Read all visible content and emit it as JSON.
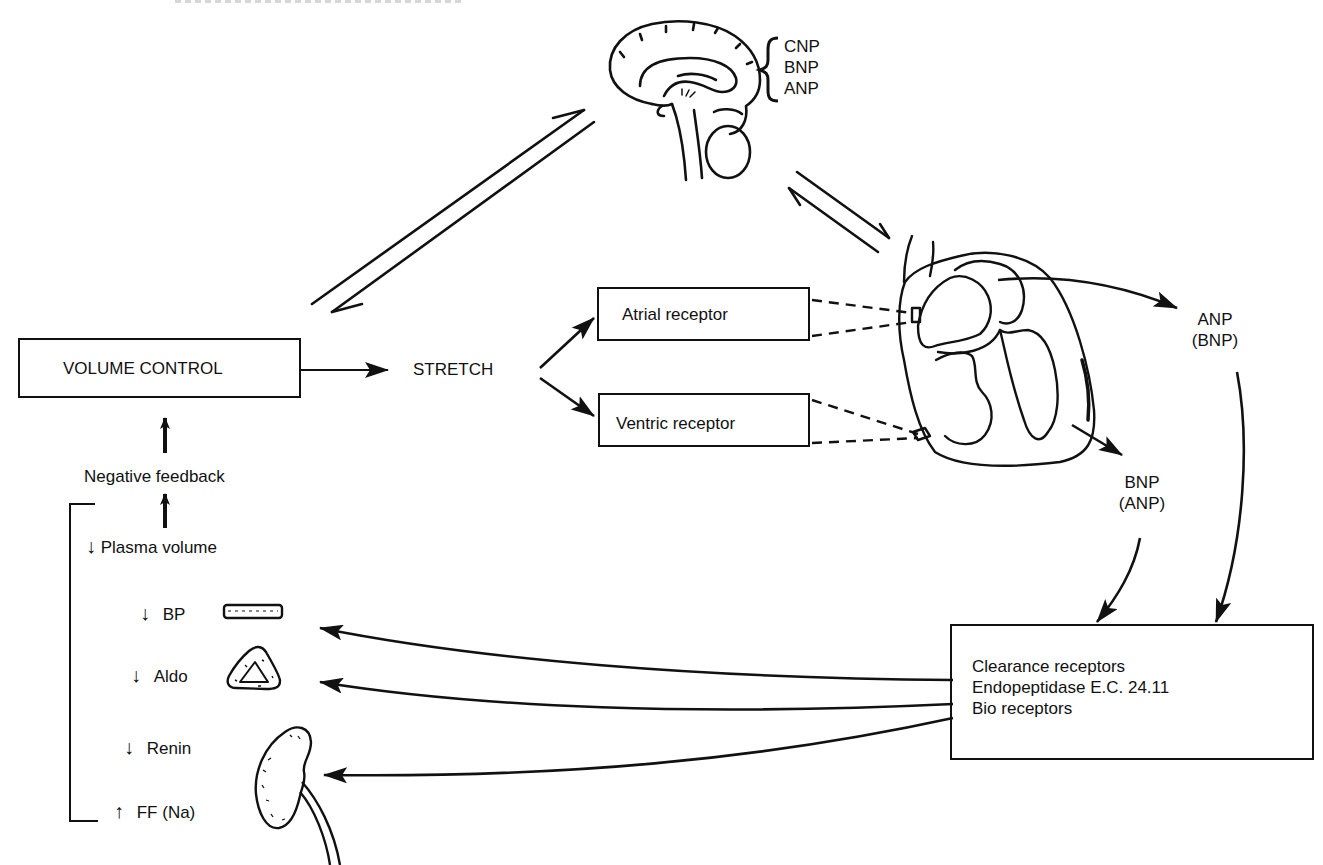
{
  "diagram": {
    "type": "physiology-flow-diagram",
    "brain": {
      "icon": "brain-sagittal-icon",
      "peptides": [
        "CNP",
        "BNP",
        "ANP"
      ]
    },
    "volume_control": {
      "label": "VOLUME CONTROL"
    },
    "stretch": {
      "label": "STRETCH"
    },
    "receptors": {
      "atrial": "Atrial receptor",
      "ventric": "Ventric receptor"
    },
    "heart": {
      "icon": "heart-cross-section-icon"
    },
    "outputs": {
      "anp_primary": [
        "ANP",
        "(BNP)"
      ],
      "bnp_primary": [
        "BNP",
        "(ANP)"
      ]
    },
    "clearance_box": {
      "lines": [
        "Clearance receptors",
        "Endopeptidase E.C. 24.11",
        "Bio receptors"
      ]
    },
    "feedback": {
      "label": "Negative feedback",
      "plasma_volume": {
        "arrow": "↓",
        "label": "Plasma volume"
      },
      "effects": [
        {
          "arrow": "↓",
          "label": "BP",
          "icon": "blood-vessel-icon"
        },
        {
          "arrow": "↓",
          "label": "Aldo",
          "icon": "adrenal-gland-icon"
        },
        {
          "arrow": "↓",
          "label": "Renin",
          "icon": "kidney-icon"
        },
        {
          "arrow": "↑",
          "label": "FF (Na)",
          "icon": ""
        }
      ]
    }
  },
  "colors": {
    "ink": "#111111",
    "background": "#ffffff"
  }
}
